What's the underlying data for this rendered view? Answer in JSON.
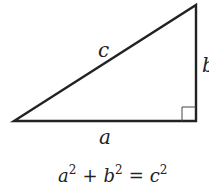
{
  "diagram": {
    "labels": {
      "hypotenuse": "c",
      "vertical_leg": "b",
      "horizontal_leg": "a"
    },
    "equation": {
      "a": "a",
      "b": "b",
      "c": "c",
      "exp": "2",
      "plus": "+",
      "equals": "="
    },
    "colors": {
      "stroke": "#222222",
      "background": "#ffffff"
    }
  }
}
